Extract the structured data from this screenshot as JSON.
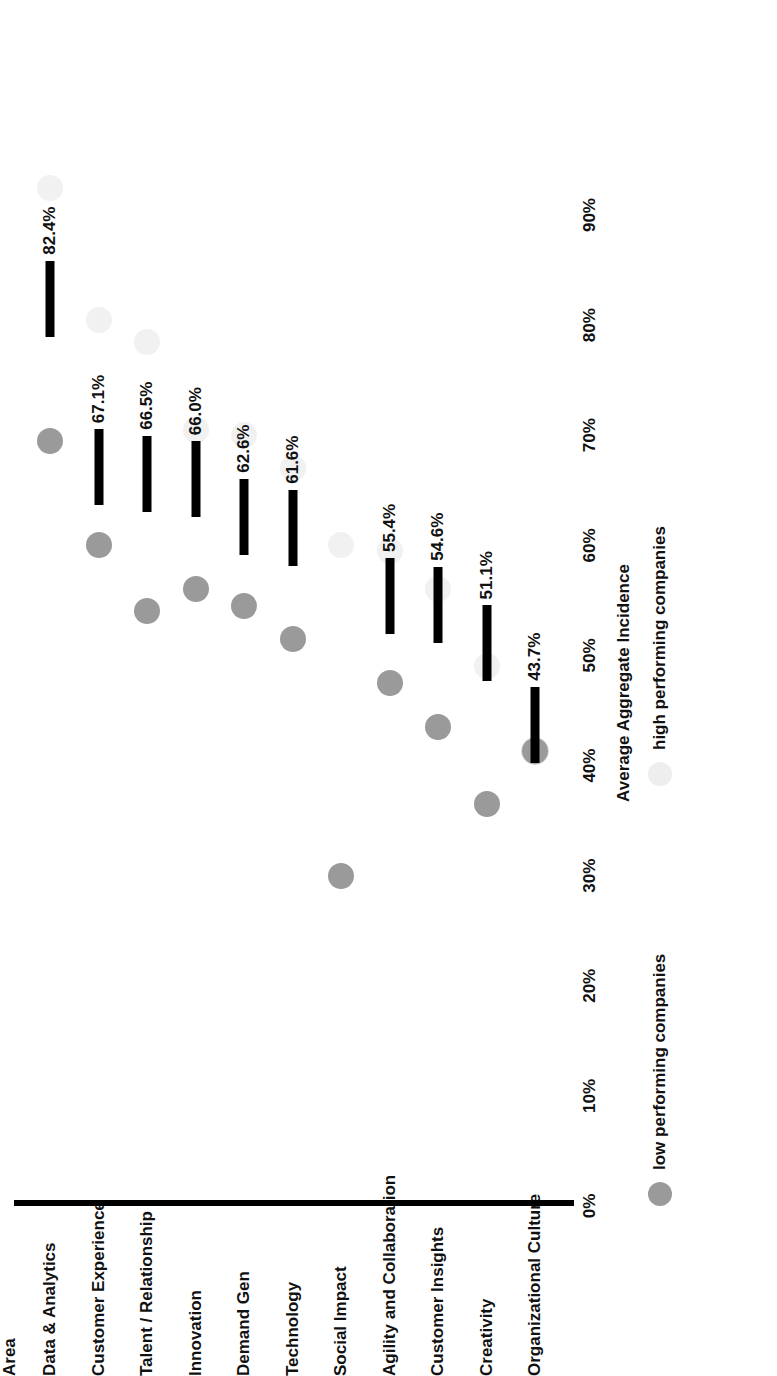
{
  "chart_data": {
    "type": "bar",
    "title": "",
    "xlabel": "Average Aggregate Incidence",
    "ylabel": "Area",
    "categories": [
      "Data & Analytics",
      "Customer Experience",
      "Talent / Relationship",
      "Innovation",
      "Demand Gen",
      "Technology",
      "Social Impact",
      "Agility and Collaboration",
      "Customer Insights",
      "Creativity",
      "Organizational Culture"
    ],
    "values": [
      82.4,
      67.1,
      66.5,
      66.0,
      62.6,
      61.6,
      null,
      55.4,
      54.6,
      51.1,
      43.7
    ],
    "value_labels": [
      "82.4%",
      "67.1%",
      "66.5%",
      "66.0%",
      "62.6%",
      "61.6%",
      "",
      "55.4%",
      "54.6%",
      "51.1%",
      "43.7%"
    ],
    "xticks": [
      "0%",
      "10%",
      "20%",
      "30%",
      "40%",
      "50%",
      "60%",
      "70%",
      "80%",
      "90%"
    ],
    "xtick_values": [
      0,
      10,
      20,
      30,
      40,
      50,
      60,
      70,
      80,
      90
    ],
    "xlim": [
      0,
      95
    ],
    "grid": false,
    "legend_position": "bottom",
    "series": [
      {
        "name": "Average Aggregate Incidence",
        "marker": "bar",
        "values": [
          82.4,
          67.1,
          66.5,
          66.0,
          62.6,
          61.6,
          null,
          55.4,
          54.6,
          51.1,
          43.7
        ],
        "labels": [
          "82.4%",
          "67.1%",
          "66.5%",
          "66.0%",
          "62.6%",
          "61.6%",
          "",
          "55.4%",
          "54.6%",
          "51.1%",
          "43.7%"
        ]
      },
      {
        "name": "low performing companies",
        "marker": "circle",
        "color": "#9a9a9a",
        "values": [
          69.5,
          60.0,
          54.0,
          56.0,
          54.5,
          51.5,
          30.0,
          47.5,
          43.5,
          36.5,
          41.3
        ]
      },
      {
        "name": "high performing companies",
        "marker": "circle",
        "color": "#f1f1f1",
        "values": [
          92.5,
          80.5,
          78.5,
          70.5,
          70.0,
          67.0,
          60.0,
          59.5,
          56.0,
          49.0,
          41.3
        ]
      }
    ]
  },
  "legend": {
    "items": [
      {
        "label": "low performing companies",
        "swatch": "low-performing-swatch"
      },
      {
        "label": "high performing companies",
        "swatch": "high-performing-swatch"
      }
    ]
  },
  "axis": {
    "category_title": "Area",
    "value_title": "Average Aggregate Incidence"
  }
}
